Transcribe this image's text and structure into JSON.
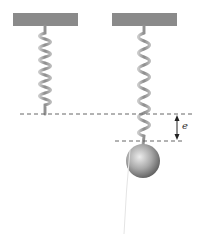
{
  "diagram": {
    "label_extension": "e",
    "colors": {
      "plate": "#8a8a8a",
      "spring": "#9a9a9a",
      "dashed_line": "#666666",
      "ball_light": "#e6e6e6",
      "ball_dark": "#6e6e6e",
      "arrow": "#222222"
    },
    "left_system": {
      "plate": {
        "x": 13,
        "y": 13,
        "w": 65,
        "h": 13
      },
      "spring_bottom_y": 114
    },
    "right_system": {
      "plate": {
        "x": 112,
        "y": 13,
        "w": 65,
        "h": 13
      },
      "spring_bottom_y": 141,
      "ball": {
        "cx": 143,
        "cy": 161,
        "r": 17
      }
    },
    "reference_lines": [
      {
        "name": "natural-length",
        "y": 114,
        "x1": 20,
        "x2": 195
      },
      {
        "name": "extended-length",
        "y": 141,
        "x1": 115,
        "x2": 185
      }
    ]
  }
}
